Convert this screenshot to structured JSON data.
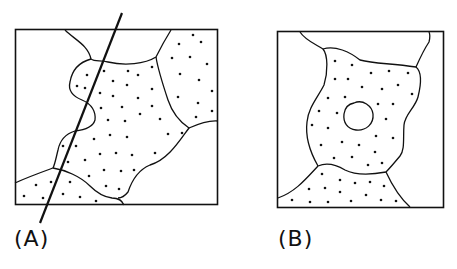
{
  "figure": {
    "panels": [
      {
        "id": "A",
        "label": "(A)",
        "description": "Grain map with a straight section line crossing dotted grains"
      },
      {
        "id": "B",
        "label": "(B)",
        "description": "Grain map with central dotted grain containing an inclusion"
      }
    ],
    "colors": {
      "stroke": "#111111",
      "background": "#ffffff"
    }
  }
}
